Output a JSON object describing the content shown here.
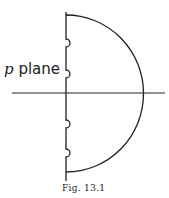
{
  "diagram": {
    "plane_label_var": "p",
    "plane_label_text": "plane",
    "caption": "Fig. 13.1",
    "colors": {
      "stroke": "#222222",
      "background": "#ffffff"
    }
  }
}
